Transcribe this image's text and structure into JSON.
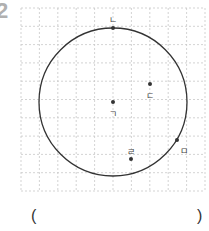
{
  "problem": {
    "number": "2"
  },
  "answer_blank": {
    "left_paren": "(",
    "right_paren": ")"
  },
  "grid": {
    "left": 21,
    "top": 8,
    "cols": 10,
    "rows": 10,
    "cell_w": 18.4,
    "cell_h": 18.3,
    "line_color": "#c8c8c8"
  },
  "circle": {
    "cx": 113,
    "cy": 102,
    "r": 74,
    "stroke": "#333333"
  },
  "points": [
    {
      "id": "giyeok",
      "label": "ㄱ",
      "x": 113,
      "y": 102,
      "lx": 113,
      "ly": 114
    },
    {
      "id": "nieun",
      "label": "ㄴ",
      "x": 113,
      "y": 28,
      "lx": 113,
      "ly": 20
    },
    {
      "id": "digeut",
      "label": "ㄷ",
      "x": 150,
      "y": 84,
      "lx": 150,
      "ly": 96
    },
    {
      "id": "rieul",
      "label": "ㄹ",
      "x": 131,
      "y": 159,
      "lx": 131,
      "ly": 152
    },
    {
      "id": "mieum",
      "label": "ㅁ",
      "x": 177,
      "y": 140,
      "lx": 184,
      "ly": 151
    }
  ]
}
